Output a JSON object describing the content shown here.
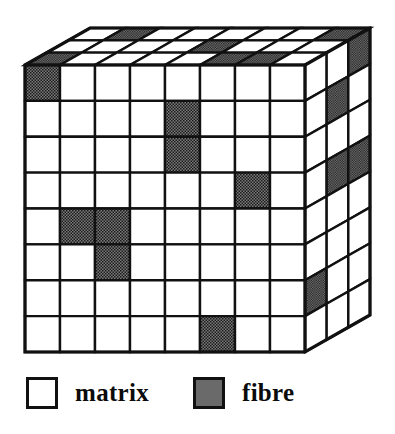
{
  "colors": {
    "line": "#111111",
    "matrix_fill": "#ffffff",
    "fibre_fill": "#6a6a6a",
    "fibre_dot": "#111111",
    "background": "#ffffff"
  },
  "geometry": {
    "front_cols": 8,
    "front_rows": 8,
    "depth": 3,
    "front_left_x": 25,
    "front_right_x": 305,
    "front_top_y": 65,
    "front_bottom_y": 352,
    "depth_dx": 65,
    "depth_dy": -37,
    "stroke_outer": 3.2,
    "stroke_inner": 2.4
  },
  "chart_data": {
    "type": "heatmap",
    "legend_position": "bottom",
    "categories": [
      "matrix",
      "fibre"
    ],
    "front_face": {
      "rows": 8,
      "cols": 8,
      "fibre_cells": [
        [
          0,
          0
        ],
        [
          1,
          4
        ],
        [
          2,
          4
        ],
        [
          3,
          6
        ],
        [
          4,
          1
        ],
        [
          4,
          2
        ],
        [
          5,
          2
        ],
        [
          7,
          5
        ]
      ]
    },
    "top_face": {
      "rows": 3,
      "cols": 8,
      "fibre_cells": [
        [
          0,
          1
        ],
        [
          0,
          7
        ],
        [
          1,
          4
        ],
        [
          2,
          0
        ],
        [
          2,
          5
        ],
        [
          2,
          6
        ]
      ]
    },
    "right_face": {
      "rows": 8,
      "cols": 3,
      "fibre_cells": [
        [
          0,
          2
        ],
        [
          1,
          1
        ],
        [
          3,
          1
        ],
        [
          3,
          2
        ],
        [
          6,
          0
        ]
      ]
    }
  },
  "legend": {
    "items": [
      {
        "label": "matrix",
        "swatch": "matrix-swatch"
      },
      {
        "label": "fibre",
        "swatch": "fibre-swatch"
      }
    ]
  }
}
